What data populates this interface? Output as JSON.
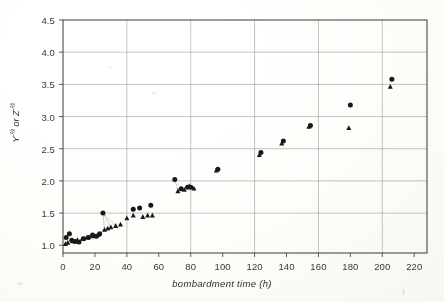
{
  "chart_data": {
    "type": "scatter",
    "title": "",
    "xlabel": "bombardment time (h)",
    "ylabel": "Y^-1/2 or Z^-1/2",
    "ylabel_plain": "Y⁻½ or Z⁻½",
    "xlim": [
      0,
      228
    ],
    "ylim": [
      0.88,
      4.5
    ],
    "xticks": [
      0,
      20,
      40,
      60,
      80,
      100,
      120,
      140,
      160,
      180,
      200,
      220
    ],
    "xtick_labels": [
      "0",
      "20",
      "40",
      "60",
      "80",
      "100",
      "120",
      "140",
      "160",
      "180",
      "200",
      "220"
    ],
    "yticks": [
      1.0,
      1.5,
      2.0,
      2.5,
      3.0,
      3.5,
      4.0,
      4.5
    ],
    "ytick_labels": [
      "1.0",
      "1.5",
      "2.0",
      "2.5",
      "3.0",
      "3.5",
      "4.0",
      "4.5"
    ],
    "gridlines_x": [
      40,
      80,
      120,
      160,
      200
    ],
    "gridlines_y": [
      1.5,
      2.0,
      2.5,
      3.0,
      3.5,
      4.0
    ],
    "grid": true,
    "legend": "none",
    "series": [
      {
        "name": "Y^-1/2",
        "marker": "circle",
        "color": "#1a1a1a",
        "points": [
          [
            2.0,
            1.12
          ],
          [
            4.0,
            1.18
          ],
          [
            5.5,
            1.08
          ],
          [
            7.5,
            1.06
          ],
          [
            10.0,
            1.05
          ],
          [
            13.0,
            1.1
          ],
          [
            16.0,
            1.12
          ],
          [
            18.5,
            1.16
          ],
          [
            21.0,
            1.14
          ],
          [
            23.0,
            1.18
          ],
          [
            25.0,
            1.5
          ],
          [
            44.0,
            1.56
          ],
          [
            48.0,
            1.58
          ],
          [
            55.0,
            1.62
          ],
          [
            70.0,
            2.02
          ],
          [
            74.0,
            1.88
          ],
          [
            78.0,
            1.9
          ],
          [
            80.0,
            1.9
          ],
          [
            97.0,
            2.18
          ],
          [
            124.0,
            2.44
          ],
          [
            138.0,
            2.62
          ],
          [
            155.0,
            2.86
          ],
          [
            180.0,
            3.18
          ],
          [
            206.0,
            3.58
          ]
        ]
      },
      {
        "name": "Z^-1/2",
        "marker": "triangle",
        "color": "#1a1a1a",
        "points": [
          [
            1.5,
            1.02
          ],
          [
            3.0,
            1.04
          ],
          [
            6.0,
            1.06
          ],
          [
            9.0,
            1.08
          ],
          [
            12.0,
            1.1
          ],
          [
            15.0,
            1.12
          ],
          [
            19.0,
            1.14
          ],
          [
            22.0,
            1.16
          ],
          [
            26.0,
            1.24
          ],
          [
            28.0,
            1.26
          ],
          [
            30.0,
            1.28
          ],
          [
            33.0,
            1.3
          ],
          [
            36.0,
            1.32
          ],
          [
            40.0,
            1.42
          ],
          [
            44.0,
            1.46
          ],
          [
            50.0,
            1.44
          ],
          [
            53.0,
            1.46
          ],
          [
            56.0,
            1.46
          ],
          [
            72.0,
            1.84
          ],
          [
            76.0,
            1.86
          ],
          [
            79.0,
            1.92
          ],
          [
            82.0,
            1.88
          ],
          [
            96.0,
            2.16
          ],
          [
            123.0,
            2.4
          ],
          [
            137.0,
            2.58
          ],
          [
            154.0,
            2.84
          ],
          [
            179.0,
            2.82
          ],
          [
            205.0,
            3.46
          ]
        ]
      }
    ],
    "connectors": [
      {
        "from": [
          25.0,
          1.5
        ],
        "to": [
          26.0,
          1.24
        ]
      },
      {
        "from": [
          25.0,
          1.5
        ],
        "to": [
          30.0,
          1.28
        ]
      },
      {
        "from": [
          25.0,
          1.5
        ],
        "to": [
          33.0,
          1.3
        ]
      },
      {
        "from": [
          70.0,
          2.02
        ],
        "to": [
          72.0,
          1.84
        ]
      }
    ]
  },
  "axes": {
    "x_title": "bombardment time (h)",
    "y_title_main": "Y",
    "y_title_mid": " or Z",
    "y_exp": "-½"
  }
}
